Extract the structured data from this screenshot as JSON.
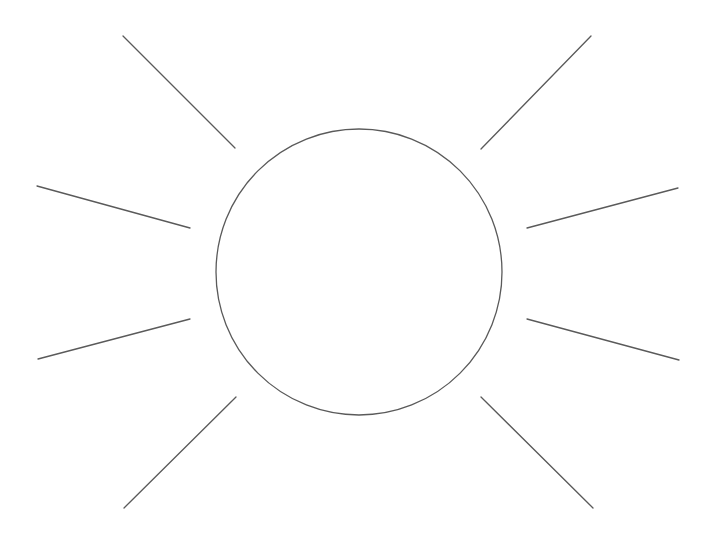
{
  "drawing": {
    "subject": "sun",
    "stroke_color": "#5a5a5a",
    "background_color": "#ffffff",
    "circle": {
      "cx": 359,
      "cy": 272,
      "r": 143
    },
    "rays": [
      {
        "name": "ray-upper-left",
        "x1": 123,
        "y1": 36,
        "x2": 235,
        "y2": 148
      },
      {
        "name": "ray-left-upper",
        "x1": 37,
        "y1": 186,
        "x2": 190,
        "y2": 228
      },
      {
        "name": "ray-left-lower",
        "x1": 38,
        "y1": 359,
        "x2": 190,
        "y2": 319
      },
      {
        "name": "ray-lower-left",
        "x1": 124,
        "y1": 508,
        "x2": 236,
        "y2": 397
      },
      {
        "name": "ray-upper-right",
        "x1": 481,
        "y1": 149,
        "x2": 591,
        "y2": 36
      },
      {
        "name": "ray-right-upper",
        "x1": 527,
        "y1": 228,
        "x2": 678,
        "y2": 188
      },
      {
        "name": "ray-right-lower",
        "x1": 527,
        "y1": 319,
        "x2": 679,
        "y2": 360
      },
      {
        "name": "ray-lower-right",
        "x1": 481,
        "y1": 397,
        "x2": 593,
        "y2": 508
      }
    ]
  }
}
